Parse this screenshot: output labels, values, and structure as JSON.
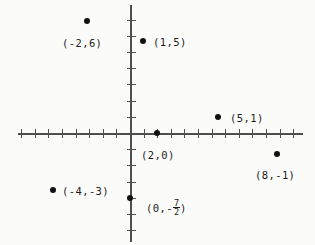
{
  "figure": {
    "kind": "cartesian-coordinate-plane",
    "background_color": "#fbfbf9",
    "axis_color": "#4e4e4e",
    "point_color": "#111111",
    "label_color": "#1b1b1b"
  },
  "axes": {
    "x_axis": {
      "name": "x-axis",
      "left_px": 18,
      "right_px": 303,
      "y_px": 133,
      "origin_px": 130,
      "tick_spacing_px": 13.6,
      "ticks_negative": 8,
      "ticks_positive": 12
    },
    "y_axis": {
      "name": "y-axis",
      "top_px": 5,
      "bottom_px": 242,
      "x_px": 130,
      "origin_px": 133,
      "tick_spacing_px": 16.2,
      "ticks_positive": 8,
      "ticks_negative": 7
    }
  },
  "chart_data": {
    "type": "scatter",
    "title": "",
    "xlabel": "",
    "ylabel": "",
    "grid": false,
    "legend": "none",
    "points": [
      {
        "label": "(-2,6)",
        "x": -2,
        "y": 6,
        "px": 87,
        "py": 21,
        "label_px": 62,
        "label_py": 38,
        "label_position": "below"
      },
      {
        "label": "(1,5)",
        "x": 1,
        "y": 5,
        "px": 143,
        "py": 41,
        "label_px": 153,
        "label_py": 37,
        "label_position": "right"
      },
      {
        "label": "(5,1)",
        "x": 5,
        "y": 1,
        "px": 218,
        "py": 117,
        "label_px": 230,
        "label_py": 113,
        "label_position": "right"
      },
      {
        "label": "(2,0)",
        "x": 2,
        "y": 0,
        "px": 157,
        "py": 133,
        "label_px": 141,
        "label_py": 150,
        "label_position": "below"
      },
      {
        "label": "(8,-1)",
        "x": 8,
        "y": -1,
        "px": 277,
        "py": 154,
        "label_px": 255,
        "label_py": 170,
        "label_position": "below"
      },
      {
        "label": "(-4,-3)",
        "x": -4,
        "y": -3,
        "px": 53,
        "py": 190,
        "label_px": 62,
        "label_py": 186,
        "label_position": "right"
      },
      {
        "label_prefix": "(0,-",
        "label_numerator": "7",
        "label_denominator": "2",
        "label_suffix": ")",
        "label": "(0,-7/2)",
        "x": 0,
        "y": -3.5,
        "px": 130,
        "py": 198,
        "label_px": 146,
        "label_py": 200,
        "label_position": "right",
        "is_fraction": true
      }
    ]
  }
}
